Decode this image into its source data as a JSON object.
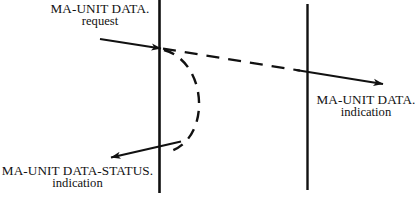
{
  "diagram": {
    "kind": "sequence-diagram",
    "background_color": "#ffffff",
    "stroke_color": "#111111",
    "labels": {
      "request": {
        "line1": "MA-UNIT DATA.",
        "line2": "request"
      },
      "data_status_indication": {
        "line1": "MA-UNIT DATA-STATUS.",
        "line2": "indication"
      },
      "data_indication": {
        "line1": "MA-UNIT DATA.",
        "line2": "indication"
      }
    },
    "lifelines": [
      {
        "name": "left-lifeline",
        "x": 159,
        "y1": 0,
        "y2": 193
      },
      {
        "name": "right-lifeline",
        "x": 307,
        "y1": 4,
        "y2": 190
      }
    ],
    "arrows": [
      {
        "name": "request-arrow",
        "style": "solid",
        "from": [
          100,
          39
        ],
        "to": [
          165,
          49
        ],
        "arrowhead": "end"
      },
      {
        "name": "propagation-arrow",
        "style": "dashed-then-solid",
        "from": [
          164,
          49
        ],
        "to": [
          385,
          84
        ],
        "arrowhead": "end"
      },
      {
        "name": "status-arc",
        "style": "dashed-arc",
        "from": [
          164,
          50
        ],
        "to": [
          168,
          152
        ],
        "bulge": "right"
      },
      {
        "name": "status-indication-arrow",
        "style": "solid",
        "from": [
          180,
          142
        ],
        "to": [
          109,
          158
        ],
        "arrowhead": "end"
      }
    ]
  }
}
